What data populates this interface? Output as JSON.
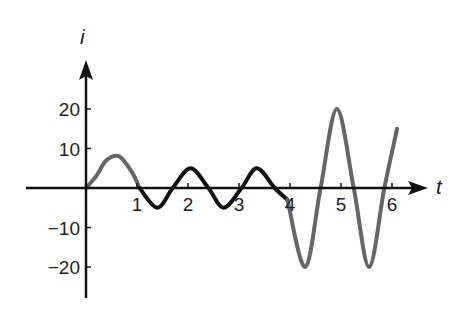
{
  "chart_data": {
    "type": "line",
    "title": "",
    "xlabel": "t",
    "ylabel": "i",
    "xlim": [
      0,
      6.1
    ],
    "ylim": [
      -28,
      28
    ],
    "grid": false,
    "legend": null,
    "x_ticks": [
      1,
      2,
      3,
      4,
      5,
      6
    ],
    "x_tick_labels": [
      "1",
      "2",
      "3",
      "4",
      "5",
      "6"
    ],
    "y_ticks": [
      20,
      10,
      -10,
      -20
    ],
    "y_tick_labels": [
      "20",
      "10",
      "-10",
      "-20"
    ],
    "series": [
      {
        "name": "initial rise",
        "color": "#666666",
        "x": [
          0,
          0.2,
          0.4,
          0.65,
          0.9,
          1.05
        ],
        "y": [
          0,
          3,
          7,
          8,
          4,
          0
        ]
      },
      {
        "name": "steady oscillation",
        "color": "#111111",
        "x": [
          1.05,
          1.4,
          1.7,
          2.05,
          2.4,
          2.7,
          3.05,
          3.35,
          3.7,
          3.95
        ],
        "y": [
          0,
          -5,
          0,
          5,
          0,
          -5,
          0,
          5,
          0,
          -3
        ]
      },
      {
        "name": "growing oscillation",
        "color": "#666666",
        "x": [
          3.95,
          4.3,
          4.6,
          4.92,
          5.25,
          5.55,
          5.85,
          6.1
        ],
        "y": [
          -3,
          -20,
          0,
          20,
          0,
          -20,
          0,
          15
        ]
      }
    ]
  },
  "axes": {
    "x_label": "t",
    "y_label": "i",
    "x_tick_labels": [
      "1",
      "2",
      "3",
      "4",
      "5",
      "6"
    ],
    "y_tick_labels": [
      "20",
      "10",
      "−10",
      "−20"
    ]
  }
}
